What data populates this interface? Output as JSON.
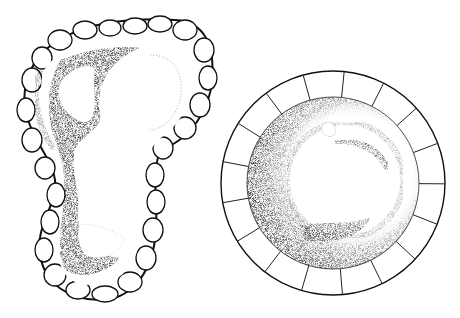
{
  "figure": {
    "left_specimen": {
      "shape": "lobed elongated foot-shaped body with beaded margin",
      "ink": "#111111"
    },
    "right_specimen": {
      "shape": "circular disc with segmented outer rim and dark inner ring",
      "segments": 17,
      "ink": "#111111"
    },
    "background": "#ffffff"
  }
}
